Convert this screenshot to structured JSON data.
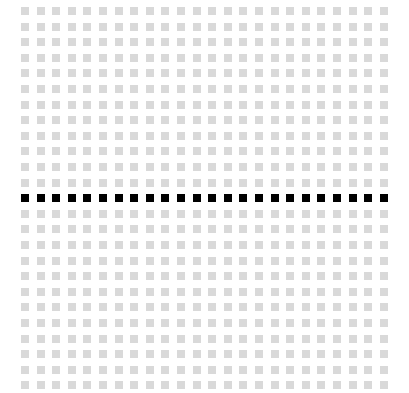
{
  "grid": {
    "rows": 25,
    "cols": 24,
    "origin_x": 21,
    "origin_y": 7,
    "pitch_x": 15.6,
    "pitch_y": 15.6,
    "cell_size": 8,
    "highlighted_row": 12,
    "colors": {
      "inactive": "#d9d9d9",
      "active": "#000000",
      "background": "#ffffff"
    }
  }
}
